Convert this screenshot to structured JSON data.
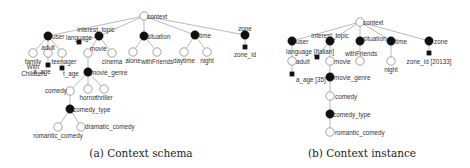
{
  "panels": [
    {
      "id": "schema",
      "caption": "(a) Context schema",
      "nodes": [
        {
          "id": "context",
          "label": "context",
          "type": "open",
          "x": 144,
          "y": 16,
          "lx": 3,
          "ly": 1,
          "anchor": "start"
        },
        {
          "id": "user",
          "label": "user",
          "type": "filled",
          "x": 48,
          "y": 36,
          "lx": 4,
          "ly": 1,
          "anchor": "start"
        },
        {
          "id": "interest_topic",
          "label": "interest_topic",
          "type": "filled",
          "x": 99,
          "y": 36,
          "lx": -3,
          "ly": -6,
          "anchor": "middle"
        },
        {
          "id": "situation",
          "label": "situation",
          "type": "filled",
          "x": 144,
          "y": 36,
          "lx": 3,
          "ly": 1,
          "anchor": "start"
        },
        {
          "id": "time",
          "label": "time",
          "type": "filled",
          "x": 195,
          "y": 35,
          "lx": 4,
          "ly": 1,
          "anchor": "start"
        },
        {
          "id": "zone",
          "label": "zone",
          "type": "filled",
          "x": 245,
          "y": 35,
          "lx": 0,
          "ly": -6,
          "anchor": "middle"
        },
        {
          "id": "family",
          "label": "family",
          "type": "open",
          "x": 33,
          "y": 53,
          "lx": 0,
          "ly": 9,
          "anchor": "middle"
        },
        {
          "id": "adult",
          "label": "adult",
          "type": "open",
          "x": 48,
          "y": 53,
          "lx": 0,
          "ly": -5,
          "anchor": "middle"
        },
        {
          "id": "teenager",
          "label": "teenager",
          "type": "open",
          "x": 62,
          "y": 53,
          "lx": 2,
          "ly": 9,
          "anchor": "middle"
        },
        {
          "id": "language",
          "label": "language",
          "type": "square",
          "x": 79,
          "y": 42,
          "lx": 0,
          "ly": -4,
          "anchor": "middle"
        },
        {
          "id": "movie",
          "label": "movie",
          "type": "open",
          "x": 88,
          "y": 53,
          "lx": 2,
          "ly": -4,
          "anchor": "start"
        },
        {
          "id": "cinema",
          "label": "cinema",
          "type": "open",
          "x": 112,
          "y": 53,
          "lx": 0,
          "ly": 9,
          "anchor": "middle"
        },
        {
          "id": "alone",
          "label": "alone",
          "type": "open",
          "x": 133,
          "y": 52,
          "lx": 0,
          "ly": 9,
          "anchor": "middle"
        },
        {
          "id": "withFriends",
          "label": "withFriends",
          "type": "open",
          "x": 157,
          "y": 52,
          "lx": 0,
          "ly": 10,
          "anchor": "middle"
        },
        {
          "id": "daytime",
          "label": "daytime",
          "type": "open",
          "x": 184,
          "y": 52,
          "lx": 0,
          "ly": 9,
          "anchor": "middle"
        },
        {
          "id": "night",
          "label": "night",
          "type": "open",
          "x": 207,
          "y": 52,
          "lx": 0,
          "ly": 9,
          "anchor": "middle"
        },
        {
          "id": "zone_id",
          "label": "zone_id",
          "type": "square",
          "x": 245,
          "y": 47,
          "lx": 0,
          "ly": 8,
          "anchor": "middle"
        },
        {
          "id": "a_age",
          "label": "a_age",
          "type": "square",
          "x": 48,
          "y": 65,
          "lx": -6,
          "ly": 7,
          "anchor": "middle"
        },
        {
          "id": "t_age",
          "label": "t_age",
          "type": "square",
          "x": 62,
          "y": 68,
          "lx": 1,
          "ly": 6,
          "anchor": "start"
        },
        {
          "id": "movie_genre",
          "label": "movie_genre",
          "type": "filled",
          "x": 88,
          "y": 72,
          "lx": 3,
          "ly": 1,
          "anchor": "start"
        },
        {
          "id": "comedy",
          "label": "comedy",
          "type": "open",
          "x": 70,
          "y": 91,
          "lx": -3,
          "ly": 0,
          "anchor": "end"
        },
        {
          "id": "horror",
          "label": "horror",
          "type": "open",
          "x": 88,
          "y": 89,
          "lx": 0,
          "ly": 9,
          "anchor": "middle"
        },
        {
          "id": "thriller",
          "label": "thriller",
          "type": "open",
          "x": 104,
          "y": 89,
          "lx": 0,
          "ly": 9,
          "anchor": "middle"
        },
        {
          "id": "comedy_type",
          "label": "comedy_type",
          "type": "filled",
          "x": 70,
          "y": 109,
          "lx": 3,
          "ly": 1,
          "anchor": "start"
        },
        {
          "id": "romantic_comedy",
          "label": "romantic_comedy",
          "type": "open",
          "x": 58,
          "y": 127,
          "lx": 0,
          "ly": 9,
          "anchor": "middle"
        },
        {
          "id": "dramatic_comedy",
          "label": "dramatic_comedy",
          "type": "open",
          "x": 81,
          "y": 127,
          "lx": 4,
          "ly": 0,
          "anchor": "start"
        }
      ],
      "edges": [
        [
          "context",
          "user"
        ],
        [
          "context",
          "interest_topic"
        ],
        [
          "context",
          "situation"
        ],
        [
          "context",
          "time"
        ],
        [
          "context",
          "zone"
        ],
        [
          "user",
          "family"
        ],
        [
          "user",
          "adult"
        ],
        [
          "user",
          "teenager"
        ],
        [
          "interest_topic",
          "language"
        ],
        [
          "interest_topic",
          "movie"
        ],
        [
          "interest_topic",
          "cinema"
        ],
        [
          "situation",
          "alone"
        ],
        [
          "situation",
          "withFriends"
        ],
        [
          "time",
          "daytime"
        ],
        [
          "time",
          "night"
        ],
        [
          "zone",
          "zone_id"
        ],
        [
          "adult",
          "a_age"
        ],
        [
          "teenager",
          "t_age"
        ],
        [
          "movie",
          "movie_genre"
        ],
        [
          "movie_genre",
          "comedy"
        ],
        [
          "movie_genre",
          "horror"
        ],
        [
          "movie_genre",
          "thriller"
        ],
        [
          "comedy",
          "comedy_type"
        ],
        [
          "comedy_type",
          "romantic_comedy"
        ],
        [
          "comedy_type",
          "dramatic_comedy"
        ]
      ],
      "extra_labels": [
        {
          "text": "With",
          "x": 33,
          "y": 69,
          "anchor": "middle"
        },
        {
          "text": "Children",
          "x": 33,
          "y": 76,
          "anchor": "middle"
        }
      ],
      "caption_pos": {
        "x": 141,
        "y": 157
      }
    },
    {
      "id": "instance",
      "caption": "(b) Context instance",
      "nodes": [
        {
          "id": "context",
          "label": "context",
          "type": "open",
          "x": 360,
          "y": 22,
          "lx": 3,
          "ly": 1,
          "anchor": "start"
        },
        {
          "id": "user",
          "label": "user",
          "type": "filled",
          "x": 292,
          "y": 41,
          "lx": 4,
          "ly": 1,
          "anchor": "start"
        },
        {
          "id": "interest_topic",
          "label": "interest_topic",
          "type": "filled",
          "x": 330,
          "y": 41,
          "lx": 0,
          "ly": -5,
          "anchor": "middle"
        },
        {
          "id": "situation",
          "label": "situation",
          "type": "filled",
          "x": 360,
          "y": 41,
          "lx": 3,
          "ly": -2,
          "anchor": "start"
        },
        {
          "id": "time",
          "label": "time",
          "type": "filled",
          "x": 391,
          "y": 41,
          "lx": 4,
          "ly": 1,
          "anchor": "start"
        },
        {
          "id": "zone",
          "label": "zone",
          "type": "filled",
          "x": 429,
          "y": 41,
          "lx": 5,
          "ly": 1,
          "anchor": "start"
        },
        {
          "id": "adult",
          "label": "adult",
          "type": "open",
          "x": 292,
          "y": 61,
          "lx": 4,
          "ly": 1,
          "anchor": "start"
        },
        {
          "id": "language",
          "label": "language [Italian]",
          "type": "square",
          "x": 317,
          "y": 57,
          "lx": -7,
          "ly": -5,
          "anchor": "middle"
        },
        {
          "id": "movie",
          "label": "movie",
          "type": "open",
          "x": 330,
          "y": 61,
          "lx": 4,
          "ly": 1,
          "anchor": "start"
        },
        {
          "id": "withFriends",
          "label": "withFriends",
          "type": "open",
          "x": 360,
          "y": 61,
          "lx": 1,
          "ly": -7,
          "anchor": "middle"
        },
        {
          "id": "night",
          "label": "night",
          "type": "open",
          "x": 391,
          "y": 61,
          "lx": 0,
          "ly": 9,
          "anchor": "middle"
        },
        {
          "id": "zone_id",
          "label": "zone_id [20133]",
          "type": "square",
          "x": 429,
          "y": 53,
          "lx": 0,
          "ly": 9,
          "anchor": "middle"
        },
        {
          "id": "a_age",
          "label": "a_age [35]",
          "type": "square",
          "x": 292,
          "y": 74,
          "lx": 4,
          "ly": 6,
          "anchor": "start"
        },
        {
          "id": "movie_genre",
          "label": "movie_genre",
          "type": "filled",
          "x": 330,
          "y": 77,
          "lx": 4,
          "ly": 1,
          "anchor": "start"
        },
        {
          "id": "comedy",
          "label": "comedy",
          "type": "open",
          "x": 330,
          "y": 96,
          "lx": 5,
          "ly": 1,
          "anchor": "start"
        },
        {
          "id": "comedy_type",
          "label": "comedy_type",
          "type": "filled",
          "x": 330,
          "y": 114,
          "lx": 3,
          "ly": 1,
          "anchor": "start"
        },
        {
          "id": "romantic_comedy",
          "label": "romantic_comedy",
          "type": "open",
          "x": 330,
          "y": 132,
          "lx": 5,
          "ly": 1,
          "anchor": "start"
        }
      ],
      "edges": [
        [
          "context",
          "user"
        ],
        [
          "context",
          "interest_topic"
        ],
        [
          "context",
          "situation"
        ],
        [
          "context",
          "time"
        ],
        [
          "context",
          "zone"
        ],
        [
          "user",
          "adult"
        ],
        [
          "adult",
          "a_age"
        ],
        [
          "interest_topic",
          "language"
        ],
        [
          "interest_topic",
          "movie"
        ],
        [
          "situation",
          "withFriends"
        ],
        [
          "time",
          "night"
        ],
        [
          "zone",
          "zone_id"
        ],
        [
          "movie",
          "movie_genre"
        ],
        [
          "movie_genre",
          "comedy"
        ],
        [
          "comedy",
          "comedy_type"
        ],
        [
          "comedy_type",
          "romantic_comedy"
        ]
      ],
      "extra_labels": [],
      "caption_pos": {
        "x": 362,
        "y": 157
      }
    }
  ]
}
